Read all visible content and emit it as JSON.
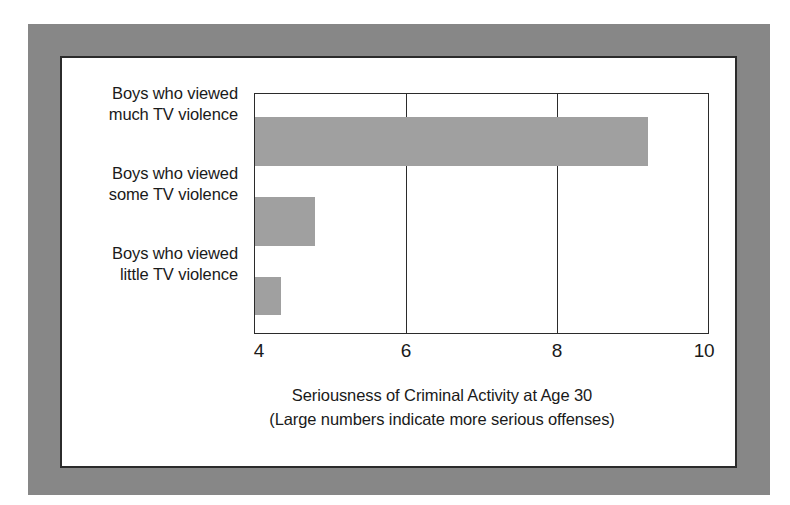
{
  "chart_data": {
    "type": "bar",
    "orientation": "horizontal",
    "title": "",
    "xlabel": "Seriousness of Criminal Activity at Age 30",
    "xlabel_note": "(Large numbers indicate more serious offenses)",
    "ylabel": "",
    "xlim": [
      4,
      10
    ],
    "xticks": [
      "4",
      "6",
      "8",
      "10"
    ],
    "xtick_values": [
      4,
      6,
      8,
      10
    ],
    "grid": "vertical-gridlines-at-6-and-8",
    "legend": "none",
    "bar_color": "#a0a0a0",
    "axis_color": "#2b2b2b",
    "categories": [
      "Boys who viewed much TV violence",
      "Boys who viewed some TV violence",
      "Boys who viewed little TV violence"
    ],
    "category_lines": [
      [
        "Boys who viewed",
        "much TV violence"
      ],
      [
        "Boys who viewed",
        "some TV violence"
      ],
      [
        "Boys who viewed",
        "little TV violence"
      ]
    ],
    "values": [
      9.2,
      4.8,
      4.35
    ]
  },
  "figure": {
    "frame_color": "#878787",
    "panel_color": "#ffffff"
  }
}
